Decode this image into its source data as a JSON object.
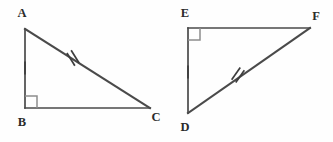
{
  "figure": {
    "kind": "geometry-diagram",
    "background_color": "#fefefe",
    "line_color": "#4a4a4a",
    "label_color": "#2b2b2b",
    "right_angle_color": "#8d8d8d",
    "canvas": {
      "width": 333,
      "height": 142
    }
  },
  "triangles": [
    {
      "id": "ABC",
      "name": "triangle-abc",
      "vertices": [
        {
          "label": "A",
          "x": 25,
          "y": 29,
          "label_x": 22,
          "label_y": 17
        },
        {
          "label": "B",
          "x": 25,
          "y": 108,
          "label_x": 22,
          "label_y": 126
        },
        {
          "label": "C",
          "x": 150,
          "y": 108,
          "label_x": 156,
          "label_y": 121
        }
      ],
      "right_angle_at": "B",
      "right_angle": {
        "x": 25,
        "y": 108,
        "size": 12,
        "dir_x": 1,
        "dir_y": -1
      },
      "sides": [
        {
          "name": "leg-ab",
          "from": "A",
          "to": "B",
          "ticks": 1
        },
        {
          "name": "leg-bc",
          "from": "B",
          "to": "C",
          "ticks": 0
        },
        {
          "name": "hypotenuse-ac",
          "from": "A",
          "to": "C",
          "ticks": 2
        }
      ],
      "tick_marks": [
        {
          "name": "single-tick-ab",
          "count": 1,
          "x": 25,
          "y": 68,
          "angle_deg": 90,
          "length": 13
        },
        {
          "name": "double-tick-ac",
          "count": 2,
          "x": 73,
          "y": 58,
          "angle_deg": 122,
          "length": 15,
          "spacing": 5
        }
      ]
    },
    {
      "id": "EDF",
      "name": "triangle-edf",
      "vertices": [
        {
          "label": "E",
          "x": 188,
          "y": 28,
          "label_x": 185,
          "label_y": 17
        },
        {
          "label": "D",
          "x": 188,
          "y": 113,
          "label_x": 185,
          "label_y": 131
        },
        {
          "label": "F",
          "x": 310,
          "y": 28,
          "label_x": 316,
          "label_y": 20
        }
      ],
      "right_angle_at": "E",
      "right_angle": {
        "x": 188,
        "y": 28,
        "size": 12,
        "dir_x": 1,
        "dir_y": 1
      },
      "sides": [
        {
          "name": "leg-ed",
          "from": "E",
          "to": "D",
          "ticks": 1
        },
        {
          "name": "leg-ef",
          "from": "E",
          "to": "F",
          "ticks": 0
        },
        {
          "name": "hypotenuse-df",
          "from": "D",
          "to": "F",
          "ticks": 2
        }
      ],
      "tick_marks": [
        {
          "name": "single-tick-ed",
          "count": 1,
          "x": 188,
          "y": 72,
          "angle_deg": 90,
          "length": 13
        },
        {
          "name": "double-tick-df",
          "count": 2,
          "x": 238,
          "y": 75,
          "angle_deg": 55,
          "length": 15,
          "spacing": 5
        }
      ]
    }
  ]
}
